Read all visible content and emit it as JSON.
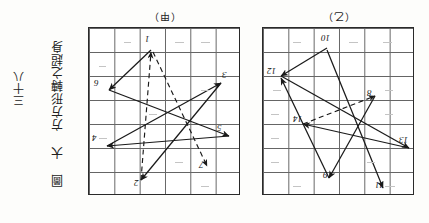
{
  "page": {
    "orientation": "rotated-180",
    "background": "#fdfdfb",
    "ink_color": "#1a1a1a"
  },
  "left_caption": {
    "text": "三十八"
  },
  "right_caption": {
    "text": "圖 大 方方形轉之超身"
  },
  "panels": [
    {
      "id": "a",
      "title": "（甲）",
      "grid": {
        "cols": 6,
        "rows": 7
      },
      "labels": [
        {
          "text": "1",
          "x": 56,
          "y": 6
        },
        {
          "text": "6",
          "x": 5,
          "y": 50
        },
        {
          "text": "3",
          "x": 133,
          "y": 42
        },
        {
          "text": "5",
          "x": 128,
          "y": 95
        },
        {
          "text": "4",
          "x": 3,
          "y": 105
        },
        {
          "text": "7",
          "x": 110,
          "y": 132
        },
        {
          "text": "2",
          "x": 45,
          "y": 150
        }
      ],
      "vectors": [
        {
          "from": [
            62,
            22
          ],
          "to": [
            20,
            62
          ],
          "style": "solid"
        },
        {
          "from": [
            20,
            62
          ],
          "to": [
            140,
            108
          ],
          "style": "solid"
        },
        {
          "from": [
            140,
            108
          ],
          "to": [
            18,
            118
          ],
          "style": "solid"
        },
        {
          "from": [
            18,
            118
          ],
          "to": [
            132,
            55
          ],
          "style": "solid"
        },
        {
          "from": [
            132,
            55
          ],
          "to": [
            52,
            152
          ],
          "style": "solid"
        },
        {
          "from": [
            52,
            152
          ],
          "to": [
            62,
            22
          ],
          "style": "dashed"
        },
        {
          "from": [
            62,
            22
          ],
          "to": [
            118,
            138
          ],
          "style": "dashed"
        }
      ]
    },
    {
      "id": "b",
      "title": "（乙）",
      "grid": {
        "cols": 6,
        "rows": 7
      },
      "labels": [
        {
          "text": "10",
          "x": 58,
          "y": 5
        },
        {
          "text": "12",
          "x": 4,
          "y": 38
        },
        {
          "text": "8",
          "x": 104,
          "y": 60
        },
        {
          "text": "14",
          "x": 30,
          "y": 86
        },
        {
          "text": "13",
          "x": 136,
          "y": 107
        },
        {
          "text": "9",
          "x": 60,
          "y": 142
        },
        {
          "text": "11",
          "x": 112,
          "y": 152
        }
      ],
      "vectors": [
        {
          "from": [
            64,
            20
          ],
          "to": [
            18,
            48
          ],
          "style": "solid"
        },
        {
          "from": [
            18,
            48
          ],
          "to": [
            146,
            120
          ],
          "style": "solid"
        },
        {
          "from": [
            146,
            120
          ],
          "to": [
            40,
            96
          ],
          "style": "solid"
        },
        {
          "from": [
            40,
            96
          ],
          "to": [
            112,
            68
          ],
          "style": "dashed"
        },
        {
          "from": [
            112,
            68
          ],
          "to": [
            66,
            150
          ],
          "style": "solid"
        },
        {
          "from": [
            66,
            150
          ],
          "to": [
            18,
            48
          ],
          "style": "solid"
        },
        {
          "from": [
            64,
            20
          ],
          "to": [
            120,
            160
          ],
          "style": "solid"
        }
      ]
    }
  ]
}
